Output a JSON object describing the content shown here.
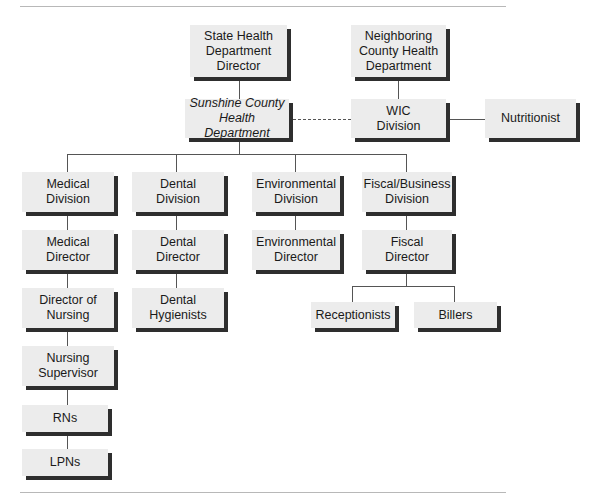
{
  "diagram": {
    "type": "org-chart",
    "nodes": {
      "state": "State Health\nDepartment\nDirector",
      "neighboring": "Neighboring\nCounty Health\nDepartment",
      "sunshine": "Sunshine County\nHealth Department",
      "wic": "WIC\nDivision",
      "nutritionist": "Nutritionist",
      "medical_division": "Medical\nDivision",
      "dental_division": "Dental\nDivision",
      "environmental_division": "Environmental\nDivision",
      "fiscal_division": "Fiscal/Business\nDivision",
      "medical_director": "Medical\nDirector",
      "dental_director": "Dental\nDirector",
      "environmental_director": "Environmental\nDirector",
      "fiscal_director": "Fiscal\nDirector",
      "director_of_nursing": "Director of\nNursing",
      "dental_hygienists": "Dental\nHygienists",
      "nursing_supervisor": "Nursing\nSupervisor",
      "rns": "RNs",
      "lpns": "LPNs",
      "receptionists": "Receptionists",
      "billers": "Billers"
    },
    "edges": [
      {
        "from": "state",
        "to": "sunshine",
        "style": "solid"
      },
      {
        "from": "neighboring",
        "to": "wic",
        "style": "solid"
      },
      {
        "from": "sunshine",
        "to": "wic",
        "style": "dashed"
      },
      {
        "from": "wic",
        "to": "nutritionist",
        "style": "solid"
      },
      {
        "from": "sunshine",
        "to": "medical_division",
        "style": "solid"
      },
      {
        "from": "sunshine",
        "to": "dental_division",
        "style": "solid"
      },
      {
        "from": "sunshine",
        "to": "environmental_division",
        "style": "solid"
      },
      {
        "from": "sunshine",
        "to": "fiscal_division",
        "style": "solid"
      },
      {
        "from": "medical_division",
        "to": "medical_director",
        "style": "solid"
      },
      {
        "from": "medical_director",
        "to": "director_of_nursing",
        "style": "solid"
      },
      {
        "from": "director_of_nursing",
        "to": "nursing_supervisor",
        "style": "solid"
      },
      {
        "from": "nursing_supervisor",
        "to": "rns",
        "style": "solid"
      },
      {
        "from": "rns",
        "to": "lpns",
        "style": "solid"
      },
      {
        "from": "dental_division",
        "to": "dental_director",
        "style": "solid"
      },
      {
        "from": "dental_director",
        "to": "dental_hygienists",
        "style": "solid"
      },
      {
        "from": "environmental_division",
        "to": "environmental_director",
        "style": "solid"
      },
      {
        "from": "fiscal_division",
        "to": "fiscal_director",
        "style": "solid"
      },
      {
        "from": "fiscal_director",
        "to": "receptionists",
        "style": "solid"
      },
      {
        "from": "fiscal_director",
        "to": "billers",
        "style": "solid"
      }
    ]
  }
}
